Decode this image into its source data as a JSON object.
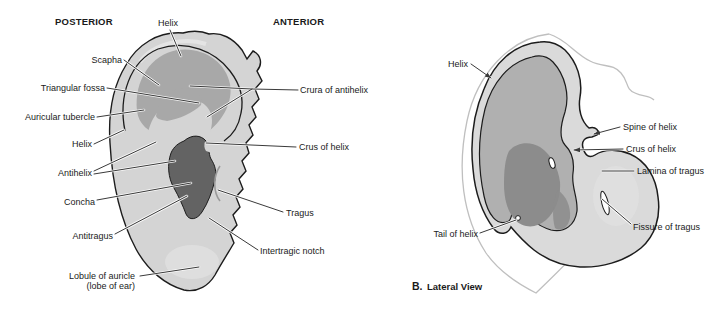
{
  "figure_a": {
    "heading_left": "POSTERIOR",
    "heading_right": "ANTERIOR",
    "labels": {
      "helix_top": "Helix",
      "scapha": "Scapha",
      "triangular_fossa": "Triangular fossa",
      "auricular_tubercle": "Auricular tubercle",
      "helix_left": "Helix",
      "antihelix": "Antihelix",
      "concha": "Concha",
      "antitragus": "Antitragus",
      "lobule_line1": "Lobule of auricle",
      "lobule_line2": "(lobe of ear)",
      "crura_of_antihelix": "Crura of antihelix",
      "crus_of_helix": "Crus of helix",
      "tragus": "Tragus",
      "intertragic_notch": "Intertragic notch"
    }
  },
  "figure_b": {
    "caption_prefix": "B.",
    "caption": "Lateral View",
    "labels": {
      "helix": "Helix",
      "spine_of_helix": "Spine of helix",
      "crus_of_helix": "Crus of helix",
      "lamina_of_tragus": "Lamina of tragus",
      "fissure_of_tragus": "Fissure of tragus",
      "tail_of_helix": "Tail of helix"
    }
  },
  "colors": {
    "bg": "#ffffff",
    "ink": "#1a1a1a",
    "outline": "#1c1c1c",
    "leader": "#3a3a3a",
    "skin": "#bfbfbf",
    "a_base": "#d4d4d4",
    "a_mid": "#a8a8a8",
    "a_dark": "#636363",
    "b_base": "#dadada",
    "b_mid": "#b0b0b0",
    "b_dark": "#8c8c8c"
  }
}
